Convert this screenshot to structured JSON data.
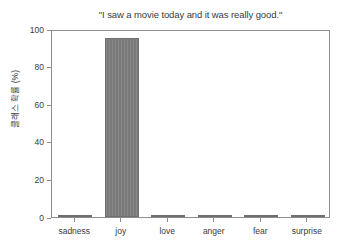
{
  "chart_data": {
    "type": "bar",
    "title": "\"I saw a movie today and it was really good.\"",
    "xlabel": "",
    "ylabel": "클래스 확률 (%)",
    "categories": [
      "sadness",
      "joy",
      "love",
      "anger",
      "fear",
      "surprise"
    ],
    "values": [
      1.0,
      95.0,
      1.3,
      0.3,
      0.3,
      0.8
    ],
    "ylim": [
      0,
      100
    ],
    "yticks": [
      "0",
      "20",
      "40",
      "60",
      "80",
      "100"
    ],
    "ytick_values": [
      0,
      20,
      40,
      60,
      80,
      100
    ],
    "grid": false,
    "legend": null,
    "bar_color": "#7a7a7a",
    "axis_color": "#8c8c8c",
    "text_color": "#3b3b3b",
    "background": "#ffffff"
  }
}
